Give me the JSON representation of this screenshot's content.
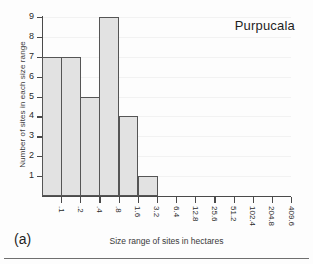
{
  "figure": {
    "caption": "(a)",
    "bottom_rule": true
  },
  "chart_data": {
    "type": "bar",
    "title": "Purpucala",
    "xlabel": "Size range of sites in hectares",
    "ylabel": "Number of sites in each size range",
    "categories": [
      ".1",
      ".2",
      ".4",
      ".8",
      "1.6",
      "3.2",
      "6.4",
      "12.8",
      "25.6",
      "51.2",
      "102.4",
      "204.8",
      "409.6"
    ],
    "values": [
      7,
      7,
      5,
      9,
      4,
      1,
      0,
      0,
      0,
      0,
      0,
      0,
      0
    ],
    "ytick_labels": [
      "1",
      "2",
      "3",
      "4",
      "5",
      "6",
      "7",
      "8",
      "9"
    ],
    "ylim": [
      0,
      9
    ],
    "xlim": [
      0,
      13
    ],
    "grid": true,
    "legend": "none",
    "bar_fill": "#e2e2e2",
    "bar_edge": "#555555",
    "axis_color": "#4a4a4a"
  }
}
